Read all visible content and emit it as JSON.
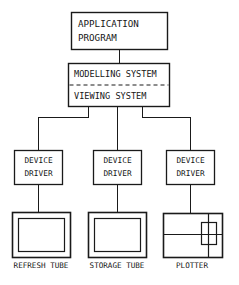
{
  "diagram": {
    "type": "block-diagram",
    "background_color": "#ffffff",
    "line_color": "#1a1a1a",
    "nodes": {
      "application": {
        "label_line1": "APPLICATION",
        "label_line2": "PROGRAM"
      },
      "system_box": {
        "label_line1": "MODELLING SYSTEM",
        "label_line2": "VIEWING SYSTEM",
        "divider_style": "dashed"
      },
      "driver_left": {
        "label_line1": "DEVICE",
        "label_line2": "DRIVER"
      },
      "driver_middle": {
        "label_line1": "DEVICE",
        "label_line2": "DRIVER"
      },
      "driver_right": {
        "label_line1": "DEVICE",
        "label_line2": "DRIVER"
      }
    },
    "devices": [
      {
        "icon": "crt-display-icon",
        "caption": "REFRESH TUBE"
      },
      {
        "icon": "crt-display-icon",
        "caption": "STORAGE TUBE"
      },
      {
        "icon": "plotter-icon",
        "caption": "PLOTTER"
      }
    ]
  }
}
